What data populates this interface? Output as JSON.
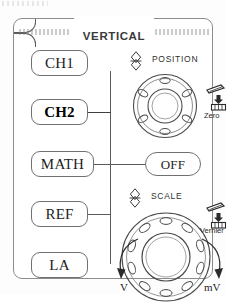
{
  "panel": {
    "title": "VERTICAL",
    "frame_color": "#8d8d8d",
    "background_color": "#ffffff",
    "ink_color": "#1d1d1d"
  },
  "channel_buttons": [
    {
      "label": "CH1",
      "emphasis": "normal"
    },
    {
      "label": "CH2",
      "emphasis": "bold"
    },
    {
      "label": "MATH",
      "emphasis": "normal"
    },
    {
      "label": "REF",
      "emphasis": "normal"
    },
    {
      "label": "LA",
      "emphasis": "normal"
    }
  ],
  "math_menu": {
    "button_label": "OFF"
  },
  "position_section": {
    "label": "POSITION",
    "arrow_icon": "up-down-arrow-icon",
    "knob_icon": "rotary-knob-icon",
    "knob_detents": 6,
    "press_action": {
      "caption": "Zero",
      "icon": "press-knob-icon"
    }
  },
  "scale_section": {
    "label": "SCALE",
    "arrow_icon": "up-down-arrow-icon",
    "knob_icon": "rotary-knob-icon",
    "knob_detents": 10,
    "press_action": {
      "caption": "Vernier",
      "icon": "press-knob-icon"
    },
    "rotation": {
      "counter_clockwise_unit": "V",
      "clockwise_unit": "mV",
      "ccw_icon": "curved-arrow-ccw-icon",
      "cw_icon": "curved-arrow-cw-icon"
    }
  }
}
